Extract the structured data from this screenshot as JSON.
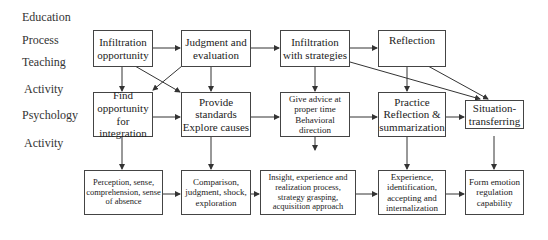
{
  "side_labels": [
    "Education",
    "Process",
    "Teaching",
    "Activity",
    "Psychology",
    "Activity"
  ],
  "rows": {
    "teaching": [
      {
        "id": "infiltration-opportunity",
        "text": "Infiltration opportunity"
      },
      {
        "id": "judgment-evaluation",
        "text": "Judgment and evaluation"
      },
      {
        "id": "infiltration-strategies",
        "text": "Infiltration with strategies"
      },
      {
        "id": "reflection",
        "text": "Reflection"
      }
    ],
    "psychology": [
      {
        "id": "find-opportunity",
        "text": "Find opportunity for integration"
      },
      {
        "id": "provide-standards",
        "text": "Provide standards Explore causes"
      },
      {
        "id": "give-advice",
        "text": "Give advice at proper time Behavioral direction"
      },
      {
        "id": "practice-reflection",
        "text": "Practice Reflection & summarization"
      },
      {
        "id": "situation-transferring",
        "text": "Situation-transferring"
      }
    ],
    "outcomes": [
      {
        "id": "perception",
        "text": "Perception, sense, comprehension, sense of absence"
      },
      {
        "id": "comparison",
        "text": "Comparison, judgment, shock, exploration"
      },
      {
        "id": "insight",
        "text": "Insight, experience and realization process, strategy grasping, acquisition approach"
      },
      {
        "id": "experience",
        "text": "Experience, identification, accepting and internalization"
      },
      {
        "id": "form-emotion",
        "text": "Form emotion regulation capability"
      }
    ]
  },
  "colors": {
    "line": "#333333",
    "box_border": "#444444",
    "background": "#ffffff"
  }
}
